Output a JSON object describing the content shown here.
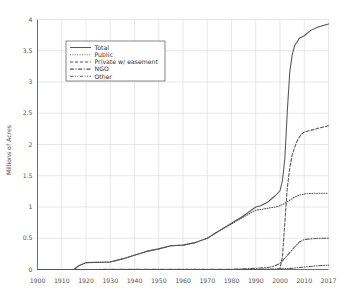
{
  "chart_data": {
    "type": "line",
    "title": "",
    "xlabel": "",
    "ylabel": "Millions of Acres",
    "xlim": [
      1900,
      2017
    ],
    "ylim": [
      0,
      4
    ],
    "grid": true,
    "legend_position": "upper-left",
    "xticks": [
      "1900",
      "1910",
      "1920",
      "1930",
      "1940",
      "1950",
      "1960",
      "1970",
      "1980",
      "1990",
      "2000",
      "2010",
      "2017"
    ],
    "yticks": [
      "0",
      "0.5",
      "1",
      "1.5",
      "2",
      "2.5",
      "3",
      "3.5",
      "4"
    ],
    "series": [
      {
        "name": "Total",
        "style": "solid",
        "x": [
          1900,
          1915,
          1917,
          1920,
          1930,
          1935,
          1940,
          1945,
          1950,
          1955,
          1960,
          1965,
          1970,
          1975,
          1980,
          1985,
          1990,
          1992,
          1995,
          1998,
          2000,
          2001,
          2002,
          2003,
          2004,
          2005,
          2006,
          2008,
          2010,
          2012,
          2014,
          2017
        ],
        "y": [
          0.0,
          0.0,
          0.06,
          0.11,
          0.12,
          0.17,
          0.23,
          0.29,
          0.33,
          0.38,
          0.39,
          0.43,
          0.5,
          0.62,
          0.74,
          0.86,
          1.0,
          1.02,
          1.08,
          1.18,
          1.26,
          1.42,
          1.78,
          2.52,
          3.15,
          3.43,
          3.58,
          3.7,
          3.74,
          3.83,
          3.88,
          3.93
        ]
      },
      {
        "name": "Public",
        "style": "dotted",
        "x": [
          1900,
          1915,
          1917,
          1920,
          1930,
          1935,
          1940,
          1945,
          1950,
          1955,
          1960,
          1965,
          1970,
          1975,
          1980,
          1985,
          1990,
          1992,
          1995,
          1998,
          2000,
          2002,
          2004,
          2006,
          2008,
          2010,
          2013,
          2017
        ],
        "y": [
          0.0,
          0.0,
          0.06,
          0.11,
          0.12,
          0.17,
          0.23,
          0.29,
          0.33,
          0.38,
          0.39,
          0.43,
          0.5,
          0.62,
          0.73,
          0.84,
          0.95,
          0.96,
          0.98,
          1.0,
          1.02,
          1.06,
          1.11,
          1.16,
          1.19,
          1.21,
          1.22,
          1.22
        ]
      },
      {
        "name": "Private w/ easement",
        "style": "dashed",
        "x": [
          1900,
          1995,
          1998,
          2000,
          2001,
          2002,
          2003,
          2004,
          2005,
          2006,
          2007,
          2008,
          2009,
          2010,
          2012,
          2014,
          2017
        ],
        "y": [
          0.0,
          0.0,
          0.0,
          0.02,
          0.2,
          0.75,
          1.3,
          1.62,
          1.83,
          1.95,
          2.05,
          2.12,
          2.17,
          2.2,
          2.23,
          2.26,
          2.3
        ]
      },
      {
        "name": "NGO",
        "style": "dashdot",
        "x": [
          1900,
          1980,
          1985,
          1988,
          1990,
          1992,
          1994,
          1996,
          1998,
          2000,
          2002,
          2004,
          2006,
          2008,
          2010,
          2012,
          2014,
          2017
        ],
        "y": [
          0.0,
          0.005,
          0.01,
          0.015,
          0.02,
          0.025,
          0.03,
          0.04,
          0.06,
          0.1,
          0.18,
          0.27,
          0.36,
          0.44,
          0.48,
          0.49,
          0.5,
          0.5
        ]
      },
      {
        "name": "Other",
        "style": "dashdotdot",
        "x": [
          1900,
          1980,
          1990,
          2000,
          2005,
          2010,
          2014,
          2017
        ],
        "y": [
          0.0,
          0.0,
          0.005,
          0.01,
          0.02,
          0.04,
          0.06,
          0.07
        ]
      }
    ]
  },
  "legend": {
    "items": [
      {
        "label": "Total"
      },
      {
        "label": "Public"
      },
      {
        "label": "Private w/ easement"
      },
      {
        "label": "NGO"
      },
      {
        "label": "Other"
      }
    ]
  },
  "colors": {
    "line": "#555555",
    "grid": "#d9d9d9",
    "axis": "#6e6e6e",
    "background": "#ffffff"
  }
}
